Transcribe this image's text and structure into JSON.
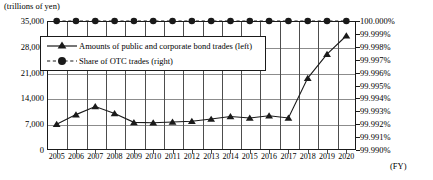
{
  "chart_data": {
    "type": "line",
    "title": "",
    "subtitle": "",
    "unit_label": "(trillions of yen)",
    "xlabel": "(FY)",
    "ylabel": "",
    "grid": true,
    "legend_position": "upper-left-inside",
    "categories": [
      "2005",
      "2006",
      "2007",
      "2008",
      "2009",
      "2010",
      "2011",
      "2012",
      "2013",
      "2014",
      "2015",
      "2016",
      "2017",
      "2018",
      "2019",
      "2020"
    ],
    "axes": {
      "left": {
        "label": "(trillions of yen)",
        "ylim": [
          0,
          35000
        ],
        "ticks": [
          0,
          7000,
          14000,
          21000,
          28000,
          35000
        ],
        "tick_labels": [
          "0",
          "7,000",
          "14,000",
          "21,000",
          "28,000",
          "35,000"
        ]
      },
      "right": {
        "ylim": [
          99.99,
          100.0
        ],
        "ticks": [
          99.99,
          99.991,
          99.992,
          99.993,
          99.994,
          99.995,
          99.996,
          99.997,
          99.998,
          99.999,
          100.0
        ],
        "tick_labels": [
          "99.990%",
          "99.991%",
          "99.992%",
          "99.993%",
          "99.994%",
          "99.995%",
          "99.996%",
          "99.997%",
          "99.998%",
          "99.999%",
          "100.000%"
        ]
      }
    },
    "series": [
      {
        "name": "Amounts of public and corporate bond trades (left)",
        "axis": "left",
        "marker": "triangle",
        "linestyle": "solid",
        "color": "#1a1a1a",
        "values": [
          7000,
          9600,
          11800,
          9900,
          7500,
          7400,
          7600,
          7800,
          8400,
          9100,
          8700,
          9300,
          8700,
          19500,
          26000,
          31000
        ]
      },
      {
        "name": "Share of OTC trades (right)",
        "axis": "right",
        "marker": "circle",
        "linestyle": "dashed",
        "color": "#1a1a1a",
        "values": [
          100.0,
          100.0,
          100.0,
          100.0,
          100.0,
          100.0,
          100.0,
          100.0,
          100.0,
          100.0,
          100.0,
          100.0,
          100.0,
          100.0,
          100.0,
          100.0
        ]
      }
    ],
    "legend": [
      "Amounts of public and corporate bond trades (left)",
      "Share of OTC trades (right)"
    ]
  }
}
